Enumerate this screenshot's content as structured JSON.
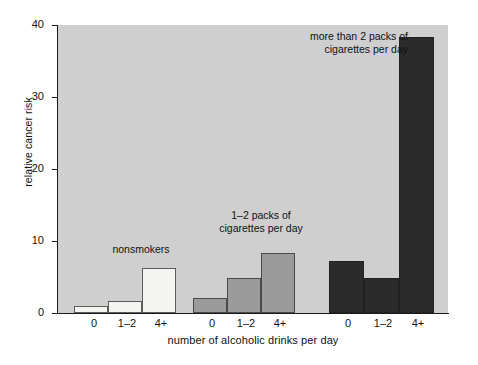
{
  "chart_data": {
    "type": "bar",
    "title": "",
    "subtitle": "",
    "xlabel": "number of alcoholic drinks per day",
    "ylabel": "relative cancer risk",
    "categories": [
      "0",
      "1–2",
      "4+"
    ],
    "ylim": [
      0,
      40
    ],
    "yticks": [
      0,
      10,
      20,
      30,
      40
    ],
    "ytick_labels": [
      "0",
      "10",
      "20",
      "30",
      "40"
    ],
    "grid": false,
    "legend_position": "in-plot annotations",
    "series": [
      {
        "name": "nonsmokers",
        "color": "#f4f4f1",
        "values": [
          1.0,
          1.6,
          6.3
        ]
      },
      {
        "name": "1–2 packs of\ncigarettes per day",
        "color": "#9b9b9b",
        "values": [
          2.1,
          4.9,
          8.3
        ]
      },
      {
        "name": "more than 2 packs of\ncigarettes per day",
        "color": "#2b2b2b",
        "values": [
          7.2,
          4.9,
          38.4
        ]
      }
    ],
    "annotations": [
      {
        "id": "nonsmokers",
        "text": "nonsmokers"
      },
      {
        "id": "onetwo",
        "text": "1–2 packs of\ncigarettes per day"
      },
      {
        "id": "morethan2",
        "text": "more than 2 packs of\ncigarettes per day"
      }
    ],
    "plot_background": "#cfcfcf",
    "figure_background": "#ffffff",
    "axis_color": "#1a1a1a"
  },
  "axis": {
    "y_title": "relative cancer risk",
    "x_title": "number of alcoholic drinks per day",
    "y_tick_labels": [
      "40",
      "30",
      "20",
      "10",
      "0"
    ],
    "x_tick_labels_group1": [
      "0",
      "1–2",
      "4+"
    ],
    "x_tick_labels_group2": [
      "0",
      "1–2",
      "4+"
    ],
    "x_tick_labels_group3": [
      "0",
      "1–2",
      "4+"
    ]
  },
  "annotations": {
    "nonsmokers": "nonsmokers",
    "onetwo": "1–2 packs of\ncigarettes per day",
    "morethan2": "more than 2 packs of\ncigarettes per day"
  }
}
